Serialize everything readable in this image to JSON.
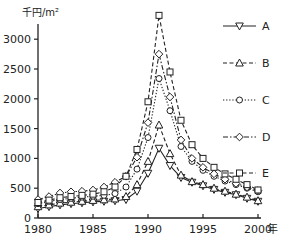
{
  "chart_data": {
    "type": "line",
    "title": "",
    "ylabel": "千円/m²",
    "xlabel": "年",
    "x": [
      1980,
      1981,
      1982,
      1983,
      1984,
      1985,
      1986,
      1987,
      1988,
      1989,
      1990,
      1991,
      1992,
      1993,
      1994,
      1995,
      1996,
      1997,
      1998,
      1999,
      2000
    ],
    "xticks": [
      1980,
      1985,
      1990,
      1995,
      2000
    ],
    "yticks": [
      0,
      500,
      1000,
      1500,
      2000,
      2500,
      3000
    ],
    "xlim": [
      1980,
      2000
    ],
    "ylim": [
      0,
      3300
    ],
    "grid": false,
    "legend_position": "right",
    "series": [
      {
        "name": "A",
        "marker": "triangle-down",
        "dash": "solid",
        "values": [
          160,
          190,
          220,
          240,
          255,
          270,
          280,
          290,
          310,
          450,
          750,
          1170,
          880,
          680,
          600,
          540,
          480,
          430,
          390,
          330,
          280
        ]
      },
      {
        "name": "B",
        "marker": "triangle-up",
        "dash": "dashed",
        "values": [
          190,
          220,
          250,
          265,
          280,
          295,
          305,
          320,
          360,
          560,
          950,
          1560,
          1080,
          720,
          610,
          560,
          500,
          450,
          400,
          350,
          290
        ]
      },
      {
        "name": "C",
        "marker": "circle",
        "dash": "dotted",
        "values": [
          240,
          280,
          310,
          330,
          350,
          365,
          380,
          410,
          520,
          820,
          1350,
          2340,
          1800,
          1200,
          950,
          800,
          700,
          620,
          560,
          500,
          440
        ]
      },
      {
        "name": "D",
        "marker": "diamond",
        "dash": "dashdot",
        "values": [
          310,
          360,
          420,
          440,
          450,
          470,
          520,
          600,
          700,
          1020,
          1600,
          2750,
          2030,
          1310,
          1000,
          850,
          740,
          650,
          580,
          520,
          460
        ]
      },
      {
        "name": "E",
        "marker": "square",
        "dash": "dashed",
        "values": [
          260,
          300,
          340,
          360,
          380,
          400,
          440,
          520,
          700,
          1150,
          1950,
          3400,
          2450,
          1640,
          1230,
          1000,
          850,
          740,
          650,
          560,
          470
        ]
      }
    ]
  },
  "axis": {
    "y_unit": "千円/m²",
    "x_unit": "年",
    "y_tick_labels": [
      "0",
      "500",
      "1000",
      "1500",
      "2000",
      "2500",
      "3000"
    ],
    "x_tick_labels": [
      "1980",
      "1985",
      "1990",
      "1995",
      "2000"
    ]
  },
  "legend": {
    "items": [
      {
        "label": "A"
      },
      {
        "label": "B"
      },
      {
        "label": "C"
      },
      {
        "label": "D"
      },
      {
        "label": "E"
      }
    ]
  },
  "colors": {
    "line": "#222222",
    "background": "#ffffff"
  }
}
